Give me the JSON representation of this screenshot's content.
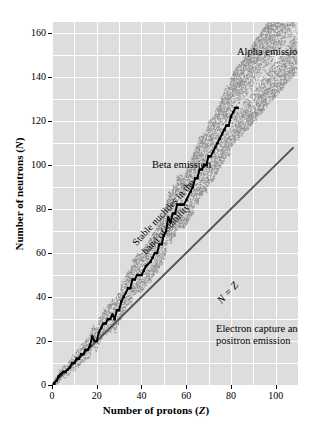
{
  "chart_data": {
    "type": "scatter",
    "title": "",
    "xlabel": "Number of protons (Z)",
    "xlabel_plain": "Number of protons",
    "xlabel_symbol": "Z",
    "ylabel": "Number of neutrons (N)",
    "ylabel_plain": "Number of neutrons",
    "ylabel_symbol": "N",
    "xlim": [
      0,
      110
    ],
    "ylim": [
      0,
      165
    ],
    "xticks": [
      0,
      20,
      40,
      60,
      80,
      100
    ],
    "yticks": [
      0,
      20,
      40,
      60,
      80,
      100,
      120,
      140,
      160
    ],
    "grid": true,
    "grid_x_step": 10,
    "grid_y_step": 10,
    "legend": "none",
    "annotations": [
      {
        "name": "alpha-emission",
        "text": "Alpha emission",
        "x": 72,
        "y": 155,
        "rotation": 0
      },
      {
        "name": "beta-emission",
        "text": "Beta emission",
        "x": 22,
        "y": 105,
        "rotation": 0
      },
      {
        "name": "electron-capture",
        "line1": "Electron capture and",
        "line2": "positron emission",
        "x": 52,
        "y": 42,
        "rotation": 0
      },
      {
        "name": "band-of-stability",
        "line1": "Stable nuclides in the",
        "line2": "band of stability",
        "x": 12,
        "y": 72,
        "rotation": -47
      },
      {
        "name": "n-equals-z",
        "text": "N = Z",
        "x": 52,
        "y": 52,
        "rotation": -47
      }
    ],
    "series": [
      {
        "name": "N = Z reference line",
        "type": "line",
        "color": "#555555",
        "points": [
          [
            0,
            0
          ],
          [
            108,
            108
          ]
        ]
      },
      {
        "name": "Stable nuclides (band of stability)",
        "type": "staircase",
        "color": "#000000",
        "description": "Black staircase of stable nuclides curving above the N = Z line",
        "points": [
          [
            1,
            0
          ],
          [
            1,
            1
          ],
          [
            2,
            2
          ],
          [
            3,
            4
          ],
          [
            4,
            5
          ],
          [
            5,
            6
          ],
          [
            6,
            6
          ],
          [
            7,
            7
          ],
          [
            8,
            8
          ],
          [
            9,
            10
          ],
          [
            10,
            10
          ],
          [
            11,
            12
          ],
          [
            12,
            12
          ],
          [
            13,
            14
          ],
          [
            14,
            14
          ],
          [
            15,
            16
          ],
          [
            16,
            16
          ],
          [
            17,
            18
          ],
          [
            18,
            22
          ],
          [
            19,
            20
          ],
          [
            20,
            20
          ],
          [
            21,
            24
          ],
          [
            22,
            26
          ],
          [
            23,
            28
          ],
          [
            24,
            28
          ],
          [
            25,
            30
          ],
          [
            26,
            30
          ],
          [
            27,
            32
          ],
          [
            28,
            30
          ],
          [
            29,
            34
          ],
          [
            30,
            34
          ],
          [
            31,
            38
          ],
          [
            32,
            40
          ],
          [
            33,
            42
          ],
          [
            34,
            44
          ],
          [
            35,
            44
          ],
          [
            36,
            48
          ],
          [
            37,
            48
          ],
          [
            38,
            50
          ],
          [
            39,
            50
          ],
          [
            40,
            50
          ],
          [
            41,
            52
          ],
          [
            42,
            54
          ],
          [
            44,
            56
          ],
          [
            45,
            58
          ],
          [
            46,
            60
          ],
          [
            47,
            60
          ],
          [
            48,
            64
          ],
          [
            49,
            64
          ],
          [
            50,
            68
          ],
          [
            51,
            70
          ],
          [
            52,
            76
          ],
          [
            53,
            74
          ],
          [
            54,
            78
          ],
          [
            55,
            78
          ],
          [
            56,
            82
          ],
          [
            57,
            82
          ],
          [
            58,
            82
          ],
          [
            59,
            82
          ],
          [
            60,
            84
          ],
          [
            62,
            88
          ],
          [
            63,
            90
          ],
          [
            64,
            94
          ],
          [
            65,
            94
          ],
          [
            66,
            98
          ],
          [
            67,
            98
          ],
          [
            68,
            100
          ],
          [
            69,
            100
          ],
          [
            70,
            104
          ],
          [
            71,
            104
          ],
          [
            72,
            106
          ],
          [
            73,
            108
          ],
          [
            74,
            110
          ],
          [
            75,
            112
          ],
          [
            76,
            114
          ],
          [
            77,
            116
          ],
          [
            78,
            118
          ],
          [
            79,
            118
          ],
          [
            80,
            122
          ],
          [
            81,
            124
          ],
          [
            82,
            126
          ],
          [
            83,
            126
          ]
        ]
      },
      {
        "name": "Known unstable nuclides (stippled band)",
        "type": "stipple-band",
        "color": "#8a8a8a",
        "description": "Dotted/stippled cloud of radioactive nuclides surrounding the stable staircase, widening toward high Z and reaching about Z = 109, N = 158"
      }
    ]
  }
}
